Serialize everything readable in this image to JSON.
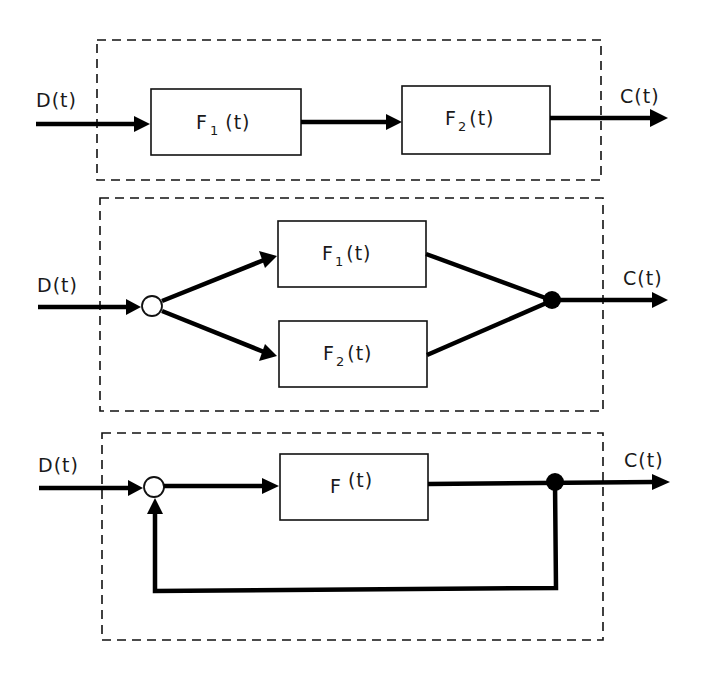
{
  "diagram": {
    "title": "",
    "panels": [
      {
        "name": "series",
        "input_label": "D(t)",
        "output_label": "C(t)",
        "blocks": [
          {
            "base": "F",
            "sub": "1",
            "suffix": "(t)"
          },
          {
            "base": "F",
            "sub": "2",
            "suffix": "(t)"
          }
        ]
      },
      {
        "name": "parallel",
        "input_label": "D(t)",
        "output_label": "C(t)",
        "blocks": [
          {
            "base": "F",
            "sub": "1",
            "suffix": "(t)"
          },
          {
            "base": "F",
            "sub": "2",
            "suffix": "(t)"
          }
        ],
        "nodes": [
          "branch-point-open",
          "summing-junction-filled"
        ]
      },
      {
        "name": "feedback",
        "input_label": "D(t)",
        "output_label": "C(t)",
        "blocks": [
          {
            "base": "F",
            "sub": "",
            "suffix": "(t)"
          }
        ],
        "nodes": [
          "summing-junction-open",
          "takeoff-point-filled"
        ]
      }
    ],
    "colors": {
      "line": "#000000",
      "background": "#ffffff"
    }
  }
}
